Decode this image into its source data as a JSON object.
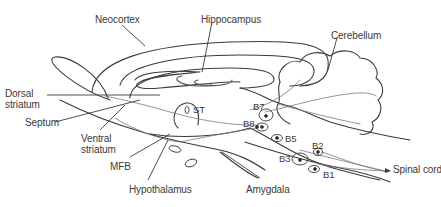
{
  "diagram": {
    "type": "sagittal brain section – noradrenergic pathways",
    "colors": {
      "line": "#3a3a3a",
      "thin_line": "#7a7a7a",
      "text": "#3a3a3a",
      "background": "#ffffff"
    },
    "labels": {
      "neocortex": "Neocortex",
      "hippocampus": "Hippocampus",
      "cerebellum": "Cerebellum",
      "dorsal_striatum_1": "Dorsal",
      "dorsal_striatum_2": "striatum",
      "septum": "Septum",
      "ventral_striatum_1": "Ventral",
      "ventral_striatum_2": "striatum",
      "mfb": "MFB",
      "hypothalamus": "Hypothalamus",
      "amygdala": "Amygdala",
      "st": "ST",
      "spinal_cord": "Spinal cord"
    },
    "cell_groups": [
      {
        "id": "B7",
        "label": "B7"
      },
      {
        "id": "B8",
        "label": "B8"
      },
      {
        "id": "B5",
        "label": "B5"
      },
      {
        "id": "B2",
        "label": "B2"
      },
      {
        "id": "B3",
        "label": "B3"
      },
      {
        "id": "B1",
        "label": "B1"
      }
    ]
  }
}
